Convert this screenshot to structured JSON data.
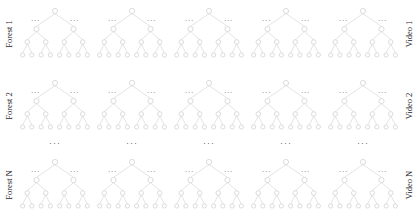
{
  "figure": {
    "title": "",
    "background_color": "#ffffff",
    "rows": [
      {
        "left_label": "Forest 1",
        "right_label": "Video 1",
        "tree_count": 5
      },
      {
        "left_label": "Forest 2",
        "right_label": "Video 2",
        "tree_count": 5
      },
      {
        "left_label": "Forest N",
        "right_label": "Video N",
        "tree_count": 5
      }
    ],
    "vertical_continuation": {
      "symbol": "⋯",
      "dots_text": "···",
      "count": 5
    },
    "tree": {
      "edge_label": "···",
      "edge_label_count_per_tree": 2,
      "levels": 4,
      "root_children": 2,
      "branching_factor": 2,
      "leaf_count": 8,
      "node_shape": "circle",
      "node_fill": "#ffffff",
      "node_stroke": "#c9c9c9",
      "edge_stroke": "#d2d2d2"
    },
    "colors": {
      "node_stroke": "#c9c9c9",
      "edge_stroke": "#d2d2d2",
      "label_text": "#1b1b1b",
      "dots_text": "#3c3c3c",
      "background": "#ffffff"
    }
  }
}
